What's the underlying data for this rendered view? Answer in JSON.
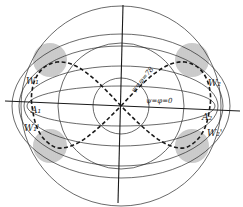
{
  "diagram": {
    "type": "projection-figure",
    "center": [
      121,
      106
    ],
    "colors": {
      "ink": "#2a2a2a",
      "hatch": "#8a8a8a",
      "background": "#ffffff"
    },
    "labels": {
      "w1": "W₁",
      "a1": "A₁",
      "w1p": "W₁'",
      "w2": "W₂",
      "a2": "A₂",
      "w2p": "W₂'",
      "diag": "ψ=φ=78",
      "horiz": "ψ=φ=0"
    }
  }
}
